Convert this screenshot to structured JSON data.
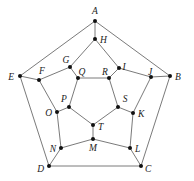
{
  "diagram": {
    "type": "graph",
    "nodes": [
      {
        "id": "A",
        "x": 95,
        "y": 21,
        "lx": 95,
        "ly": 14,
        "anchor": "middle"
      },
      {
        "id": "B",
        "x": 170,
        "y": 76,
        "lx": 175,
        "ly": 80,
        "anchor": "start"
      },
      {
        "id": "C",
        "x": 141,
        "y": 166,
        "lx": 145,
        "ly": 172,
        "anchor": "start"
      },
      {
        "id": "D",
        "x": 49,
        "y": 166,
        "lx": 44,
        "ly": 172,
        "anchor": "end"
      },
      {
        "id": "E",
        "x": 20,
        "y": 76,
        "lx": 14,
        "ly": 80,
        "anchor": "end"
      },
      {
        "id": "F",
        "x": 39,
        "y": 80,
        "lx": 42,
        "ly": 74,
        "anchor": "middle"
      },
      {
        "id": "G",
        "x": 70,
        "y": 67,
        "lx": 66,
        "ly": 63,
        "anchor": "middle"
      },
      {
        "id": "H",
        "x": 95,
        "y": 39,
        "lx": 100,
        "ly": 43,
        "anchor": "start"
      },
      {
        "id": "I",
        "x": 119,
        "y": 68,
        "lx": 124,
        "ly": 70,
        "anchor": "middle"
      },
      {
        "id": "J",
        "x": 151,
        "y": 77,
        "lx": 150,
        "ly": 75,
        "anchor": "middle"
      },
      {
        "id": "K",
        "x": 133,
        "y": 113,
        "lx": 138,
        "ly": 117,
        "anchor": "start"
      },
      {
        "id": "L",
        "x": 130,
        "y": 148,
        "lx": 135,
        "ly": 152,
        "anchor": "start"
      },
      {
        "id": "M",
        "x": 93,
        "y": 139,
        "lx": 93,
        "ly": 151,
        "anchor": "middle"
      },
      {
        "id": "N",
        "x": 61,
        "y": 148,
        "lx": 56,
        "ly": 152,
        "anchor": "end"
      },
      {
        "id": "O",
        "x": 57,
        "y": 112,
        "lx": 52,
        "ly": 116,
        "anchor": "end"
      },
      {
        "id": "P",
        "x": 69,
        "y": 107,
        "lx": 64,
        "ly": 102,
        "anchor": "middle"
      },
      {
        "id": "Q",
        "x": 78,
        "y": 78,
        "lx": 82,
        "ly": 75,
        "anchor": "middle"
      },
      {
        "id": "R",
        "x": 109,
        "y": 78,
        "lx": 105,
        "ly": 75,
        "anchor": "middle"
      },
      {
        "id": "S",
        "x": 118,
        "y": 107,
        "lx": 125,
        "ly": 102,
        "anchor": "middle"
      },
      {
        "id": "T",
        "x": 93,
        "y": 125,
        "lx": 98,
        "ly": 130,
        "anchor": "start"
      }
    ],
    "edges": [
      [
        "A",
        "B"
      ],
      [
        "B",
        "C"
      ],
      [
        "C",
        "D"
      ],
      [
        "D",
        "E"
      ],
      [
        "E",
        "A"
      ],
      [
        "A",
        "H"
      ],
      [
        "B",
        "J"
      ],
      [
        "C",
        "L"
      ],
      [
        "D",
        "N"
      ],
      [
        "E",
        "F"
      ],
      [
        "H",
        "G"
      ],
      [
        "H",
        "I"
      ],
      [
        "I",
        "J"
      ],
      [
        "J",
        "K"
      ],
      [
        "K",
        "L"
      ],
      [
        "L",
        "M"
      ],
      [
        "M",
        "N"
      ],
      [
        "N",
        "O"
      ],
      [
        "O",
        "F"
      ],
      [
        "F",
        "G"
      ],
      [
        "G",
        "Q"
      ],
      [
        "I",
        "R"
      ],
      [
        "K",
        "S"
      ],
      [
        "M",
        "T"
      ],
      [
        "O",
        "P"
      ],
      [
        "Q",
        "R"
      ],
      [
        "R",
        "S"
      ],
      [
        "S",
        "T"
      ],
      [
        "T",
        "P"
      ],
      [
        "P",
        "Q"
      ]
    ],
    "style": {
      "edge_color": "#6b6b6b",
      "node_color": "#111111",
      "label_color": "#222222",
      "node_radius": 2
    }
  }
}
